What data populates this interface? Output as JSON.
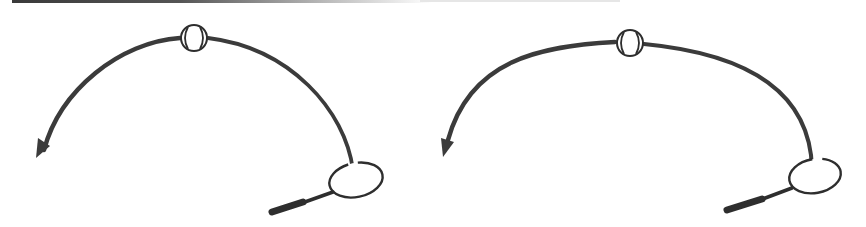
{
  "figure": {
    "stroke_color": "#3b3b3b",
    "background": "#ffffff",
    "panels": [
      {
        "id": "left",
        "label": "High arc trajectory",
        "shape": "tall rounded arc",
        "elements": [
          "racket",
          "ball at apex",
          "trajectory arc",
          "arrowhead pointing down-left"
        ]
      },
      {
        "id": "right",
        "label": "Flatter arc trajectory",
        "shape": "wider, flatter arc",
        "elements": [
          "racket",
          "ball at apex",
          "trajectory arc",
          "arrowhead pointing down-left"
        ]
      }
    ]
  }
}
